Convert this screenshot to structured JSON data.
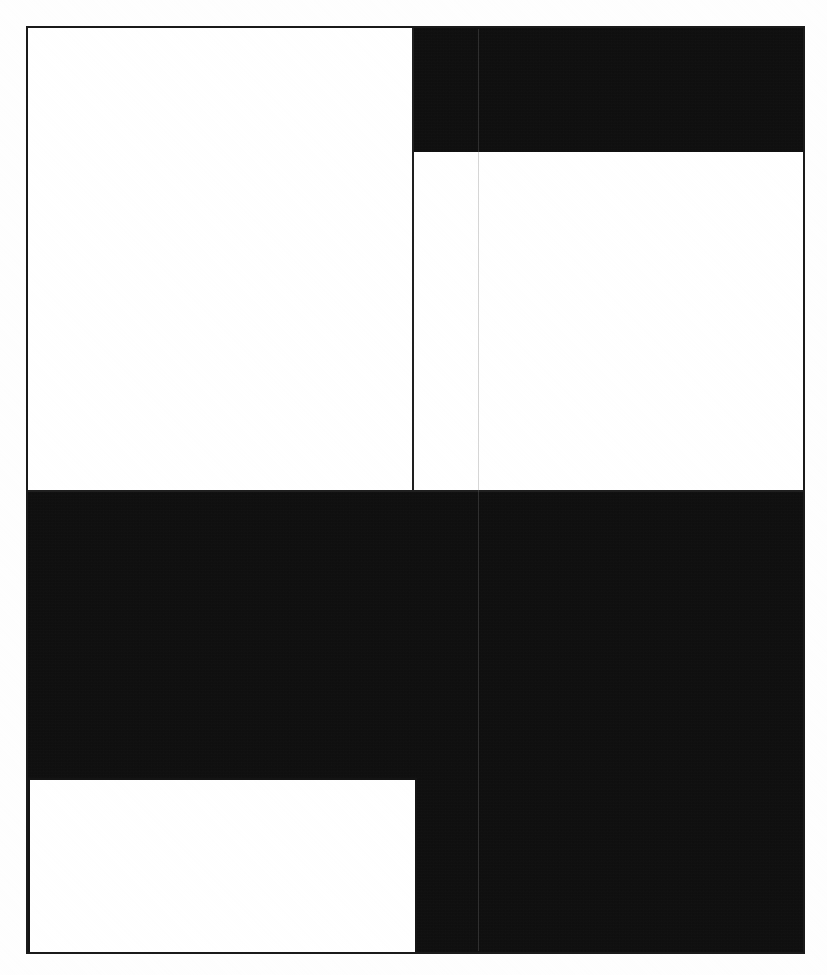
{
  "document": {
    "kind": "scanned-page",
    "page_width": 827,
    "page_height": 975,
    "background_color": "#ffffff",
    "ink_color": "#0d0d0d",
    "border_color": "#1a1a1a",
    "rule_color": "#1f1f1f",
    "faint_rule_color": "#787878",
    "visible_text": "",
    "description_label": "scanned page with solid tonal blocks"
  },
  "frame": {
    "name": "page-border",
    "left": 26,
    "top": 26,
    "width": 779,
    "height": 928,
    "stroke_width": 2,
    "color": "#1a1a1a"
  },
  "regions": [
    {
      "id": "top-left",
      "tone": "paper",
      "color": "#ffffff",
      "left": 28,
      "top": 28,
      "width": 385,
      "height": 464
    },
    {
      "id": "top-right-upper",
      "tone": "ink",
      "color": "#0d0d0d",
      "left": 413,
      "top": 28,
      "width": 390,
      "height": 124
    },
    {
      "id": "top-right-lower",
      "tone": "paper",
      "color": "#ffffff",
      "left": 415,
      "top": 152,
      "width": 388,
      "height": 340
    },
    {
      "id": "bottom-full",
      "tone": "ink",
      "color": "#0d0d0d",
      "left": 28,
      "top": 492,
      "width": 775,
      "height": 460
    },
    {
      "id": "bottom-left-inset",
      "tone": "paper",
      "color": "#ffffff",
      "left": 29,
      "top": 779,
      "width": 387,
      "height": 174
    }
  ],
  "rules": [
    {
      "id": "center-vertical-top",
      "orientation": "vertical",
      "weight": "dark",
      "color": "#1f1f1f",
      "left": 412,
      "top": 28,
      "length": 464
    },
    {
      "id": "gutter-faint",
      "orientation": "vertical",
      "weight": "faint",
      "color": "#787878",
      "left": 478,
      "top": 29,
      "length": 922
    },
    {
      "id": "mid-band",
      "orientation": "horizontal",
      "weight": "dark",
      "color": "#1f1f1f",
      "left": 28,
      "top": 490,
      "length": 776
    }
  ],
  "margins": {
    "left": 26,
    "top": 26,
    "right": 22,
    "bottom": 21
  }
}
